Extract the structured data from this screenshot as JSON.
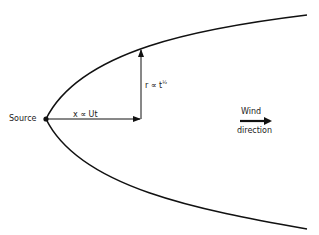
{
  "diagram": {
    "labels": {
      "source": "Source",
      "x_relation": "x ∝ Ut",
      "r_relation_base": "r ∝ t",
      "r_relation_exp": "½",
      "wind_line1": "Wind",
      "wind_line2": "direction"
    },
    "shapes": {
      "plume_boundary": "parabola opening right from source",
      "source_point": "filled dot",
      "x_arrow": "horizontal arrow from source along axis",
      "r_arrow": "vertical arrow from axis to plume boundary",
      "wind_arrow": "thick arrow pointing right"
    },
    "colors": {
      "stroke": "#111111",
      "background": "#ffffff"
    }
  }
}
